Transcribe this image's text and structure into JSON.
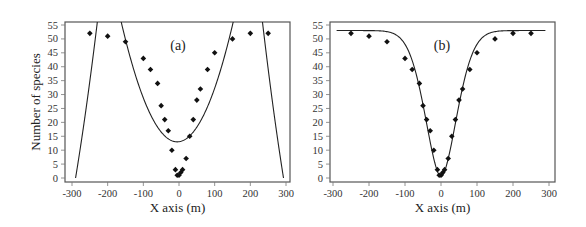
{
  "chart_data": [
    {
      "type": "scatter",
      "panel_label": "(a)",
      "title": "",
      "xlabel": "X axis (m)",
      "ylabel": "Number of species",
      "xlim": [
        -300,
        300
      ],
      "ylim": [
        0,
        55
      ],
      "xticks": [
        -300,
        -200,
        -100,
        0,
        100,
        200,
        300
      ],
      "yticks": [
        0,
        5,
        10,
        15,
        20,
        25,
        30,
        35,
        40,
        45,
        50,
        55
      ],
      "grid": false,
      "legend": null,
      "points": {
        "x": [
          -250,
          -200,
          -150,
          -100,
          -80,
          -60,
          -50,
          -40,
          -30,
          -20,
          -10,
          -5,
          0,
          5,
          10,
          20,
          30,
          40,
          50,
          60,
          80,
          100,
          150,
          200,
          250
        ],
        "y": [
          52,
          51,
          49,
          43,
          39,
          34,
          26,
          21,
          17,
          10,
          3,
          1,
          1,
          2,
          3,
          7,
          15,
          21,
          28,
          32,
          39,
          45,
          50,
          52,
          52
        ]
      },
      "fit_curve": {
        "description": "polynomial fit (poor fit): U-shaped central branch with minimum ~13 near x=0, plus outer branches dropping to 0 near x=±290",
        "min_y": 13,
        "min_x": -5
      }
    },
    {
      "type": "scatter",
      "panel_label": "(b)",
      "title": "",
      "xlabel": "X axis (m)",
      "ylabel": "",
      "xlim": [
        -300,
        300
      ],
      "ylim": [
        0,
        55
      ],
      "xticks": [
        -300,
        -200,
        -100,
        0,
        100,
        200,
        300
      ],
      "yticks": [
        0,
        5,
        10,
        15,
        20,
        25,
        30,
        35,
        40,
        45,
        50,
        55
      ],
      "grid": false,
      "legend": null,
      "points": {
        "x": [
          -250,
          -200,
          -150,
          -100,
          -80,
          -60,
          -50,
          -40,
          -30,
          -20,
          -10,
          -5,
          0,
          5,
          10,
          20,
          30,
          40,
          50,
          60,
          80,
          100,
          150,
          200,
          250
        ],
        "y": [
          52,
          51,
          49,
          43,
          39,
          34,
          26,
          21,
          17,
          10,
          3,
          1,
          1,
          2,
          3,
          7,
          15,
          21,
          28,
          32,
          39,
          45,
          50,
          52,
          52
        ]
      },
      "fit_curve": {
        "description": "inverted bell / sigmoid-type fit, minimum ~0 at x=0, asymptote ~53",
        "asymptote": 53,
        "min_y": 0.5
      }
    }
  ]
}
